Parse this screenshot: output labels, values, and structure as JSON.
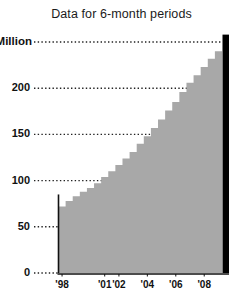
{
  "chart_data": {
    "type": "area",
    "title": "Data for 6-month periods",
    "xlabel": "",
    "ylabel": "",
    "ylim": [
      0,
      250
    ],
    "yticks": [
      0,
      50,
      100,
      150,
      200,
      250
    ],
    "ytick_labels": [
      "0",
      "50",
      "100",
      "150",
      "200",
      "$250 Million"
    ],
    "grid": true,
    "grid_style": "dotted-horizontal",
    "legend": "none",
    "units": "Millions of dollars",
    "series_style": "step",
    "categories": [
      "'98 H1",
      "'98 H2",
      "'99 H1",
      "'99 H2",
      "'00 H1",
      "'00 H2",
      "'01 H1",
      "'01 H2",
      "'02 H1",
      "'02 H2",
      "'03 H1",
      "'03 H2",
      "'04 H1",
      "'04 H2",
      "'05 H1",
      "'05 H2",
      "'06 H1",
      "'06 H2",
      "'07 H1",
      "'07 H2",
      "'08 H1",
      "'08 H2",
      "'09 H1"
    ],
    "values": [
      72,
      78,
      83,
      88,
      92,
      97,
      104,
      110,
      117,
      124,
      131,
      140,
      148,
      157,
      166,
      176,
      185,
      196,
      206,
      214,
      223,
      232,
      240
    ],
    "xtick_labels": [
      "'98",
      "'01",
      "'02",
      "'04",
      "'06",
      "'08"
    ],
    "xtick_positions": [
      0,
      6,
      8,
      12,
      16,
      20
    ],
    "annotations": [
      {
        "name": "highlight-bar",
        "description": "black vertical bar at right edge",
        "value": 258
      }
    ],
    "colors": {
      "area_fill": "#a8a8a8",
      "axis": "#111111",
      "grid": "#222222",
      "highlight": "#000000",
      "text": "#111111",
      "background": "#ffffff"
    }
  }
}
